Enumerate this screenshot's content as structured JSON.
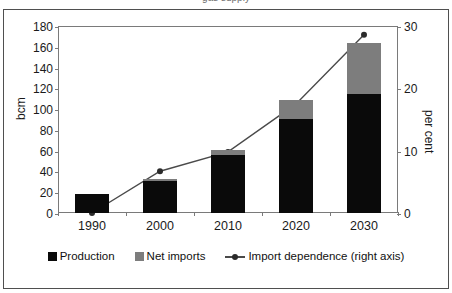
{
  "figure": {
    "title_sliver": "gas supply",
    "frame_color": "#4f4f4f",
    "background": "#ffffff"
  },
  "axes": {
    "left": {
      "label": "bcm",
      "ticks": [
        "0",
        "20",
        "40",
        "60",
        "80",
        "100",
        "120",
        "140",
        "160",
        "180"
      ],
      "min": 0,
      "max": 180
    },
    "right": {
      "label": "per cent",
      "ticks": [
        "0",
        "10",
        "20",
        "30"
      ],
      "min": 0,
      "max": 30
    },
    "x": {
      "categories": [
        "1990",
        "2000",
        "2010",
        "2020",
        "2030"
      ]
    }
  },
  "legend": {
    "items": [
      {
        "label": "Production",
        "type": "swatch",
        "color": "#0a0a0a"
      },
      {
        "label": "Net imports",
        "type": "swatch",
        "color": "#7d7d7d"
      },
      {
        "label": "Import dependence (right axis)",
        "type": "line",
        "color": "#4a4a4a"
      }
    ]
  },
  "chart_data": {
    "type": "bar",
    "title": "",
    "xlabel": "",
    "ylabel": "bcm",
    "y2label": "per cent",
    "ylim": [
      0,
      180
    ],
    "y2lim": [
      0,
      30
    ],
    "grid": false,
    "legend_position": "bottom",
    "stacked": true,
    "categories": [
      "1990",
      "2000",
      "2010",
      "2020",
      "2030"
    ],
    "series": [
      {
        "name": "Production",
        "type": "bar",
        "axis": "left",
        "unit": "bcm",
        "color": "#0a0a0a",
        "values": [
          18,
          31,
          56,
          90,
          115
        ]
      },
      {
        "name": "Net imports",
        "type": "bar",
        "axis": "left",
        "unit": "bcm",
        "color": "#7d7d7d",
        "values": [
          0,
          2,
          5,
          19,
          49
        ]
      },
      {
        "name": "Import dependence (right axis)",
        "type": "line",
        "axis": "right",
        "unit": "per cent",
        "color": "#4a4a4a",
        "values": [
          0,
          6.7,
          9.8,
          17.5,
          28.6
        ]
      }
    ],
    "totals": [
      18,
      33,
      61,
      109,
      164
    ]
  }
}
